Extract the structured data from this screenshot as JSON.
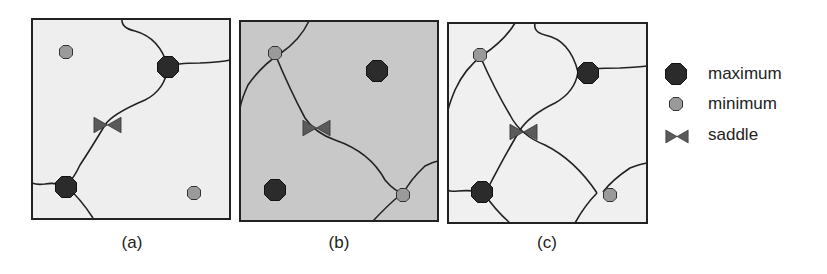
{
  "figure": {
    "panels": [
      {
        "id": "a",
        "caption": "(a)",
        "background": "#eeeeee"
      },
      {
        "id": "b",
        "caption": "(b)",
        "background": "#c8c8c8"
      },
      {
        "id": "c",
        "caption": "(c)",
        "background": "#f0f0f0"
      }
    ],
    "legend": {
      "items": [
        {
          "label": "maximum",
          "icon": "maximum-marker"
        },
        {
          "label": "minimum",
          "icon": "minimum-marker"
        },
        {
          "label": "saddle",
          "icon": "saddle-marker"
        }
      ]
    },
    "colors": {
      "maximum": "#2b2b2b",
      "minimum": "#999999",
      "saddle": "#555555",
      "line": "#222222"
    }
  }
}
